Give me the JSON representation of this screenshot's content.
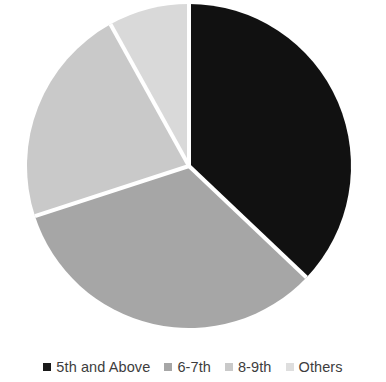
{
  "chart_data": {
    "type": "pie",
    "title": "",
    "subtitle": "",
    "xlabel": "",
    "ylabel": "",
    "grid": false,
    "legend_position": "bottom",
    "start_angle_deg": 0,
    "direction": "clockwise",
    "categories": [
      "5th and Above",
      "6-7th",
      "8-9th",
      "Others"
    ],
    "values": [
      37,
      33,
      22,
      8
    ],
    "units": "percent",
    "slice_angles_deg": [
      133.5,
      118.5,
      79.0,
      29.0
    ],
    "colors": [
      "#111111",
      "#a6a6a6",
      "#c9c9c9",
      "#d9d9d9"
    ],
    "separator_color": "#ffffff",
    "slices": [
      {
        "label": "5th and Above",
        "value": 37,
        "color": "#111111",
        "angle_deg": 133.5
      },
      {
        "label": "6-7th",
        "value": 33,
        "color": "#a6a6a6",
        "angle_deg": 118.5
      },
      {
        "label": "8-9th",
        "value": 22,
        "color": "#c9c9c9",
        "angle_deg": 79.0
      },
      {
        "label": "Others",
        "value": 8,
        "color": "#d9d9d9",
        "angle_deg": 29.0
      }
    ]
  },
  "legend": {
    "items": [
      {
        "label": "5th and Above",
        "color": "#1a1a1a"
      },
      {
        "label": "6-7th",
        "color": "#a6a6a6"
      },
      {
        "label": "8-9th",
        "color": "#c9c9c9"
      },
      {
        "label": "Others",
        "color": "#dedede"
      }
    ]
  },
  "geometry": {
    "center_x": 189,
    "center_y": 166,
    "radius": 162
  }
}
